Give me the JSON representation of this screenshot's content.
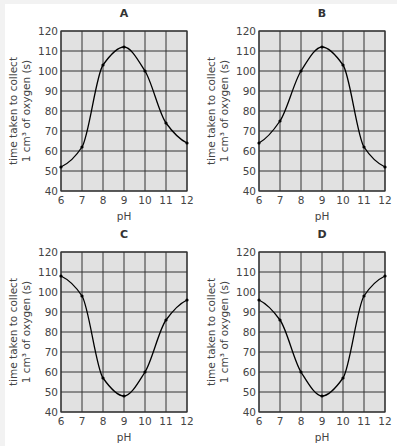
{
  "figure": {
    "background": "#f2f2f2",
    "panel_background": "#ffffff",
    "plot_fill": "#e1e1e1",
    "grid_color": "#333333",
    "curve_color": "#000000"
  },
  "chart_data": [
    {
      "type": "line",
      "title": "A",
      "xlabel": "pH",
      "ylabel_line1": "time taken to collect",
      "ylabel_line2": "1 cm³ of oxygen (s)",
      "x": [
        6,
        7,
        8,
        9,
        10,
        11,
        12
      ],
      "values": [
        52,
        62,
        103,
        112,
        100,
        74,
        64
      ],
      "xlim": [
        6,
        12
      ],
      "ylim": [
        40,
        120
      ],
      "xticks": [
        "6",
        "7",
        "8",
        "9",
        "10",
        "11",
        "12"
      ],
      "yticks": [
        "40",
        "50",
        "60",
        "70",
        "80",
        "90",
        "100",
        "110",
        "120"
      ],
      "grid": true
    },
    {
      "type": "line",
      "title": "B",
      "xlabel": "pH",
      "ylabel_line1": "time taken to collect",
      "ylabel_line2": "1 cm³ of oxygen (s)",
      "x": [
        6,
        7,
        8,
        9,
        10,
        11,
        12
      ],
      "values": [
        64,
        75,
        100,
        112,
        103,
        62,
        52
      ],
      "xlim": [
        6,
        12
      ],
      "ylim": [
        40,
        120
      ],
      "xticks": [
        "6",
        "7",
        "8",
        "9",
        "10",
        "11",
        "12"
      ],
      "yticks": [
        "40",
        "50",
        "60",
        "70",
        "80",
        "90",
        "100",
        "110",
        "120"
      ],
      "grid": true
    },
    {
      "type": "line",
      "title": "C",
      "xlabel": "pH",
      "ylabel_line1": "time taken to collect",
      "ylabel_line2": "1 cm³ of oxygen (s)",
      "x": [
        6,
        7,
        8,
        9,
        10,
        11,
        12
      ],
      "values": [
        108,
        98,
        57,
        48,
        60,
        86,
        96
      ],
      "xlim": [
        6,
        12
      ],
      "ylim": [
        40,
        120
      ],
      "xticks": [
        "6",
        "7",
        "8",
        "9",
        "10",
        "11",
        "12"
      ],
      "yticks": [
        "40",
        "50",
        "60",
        "70",
        "80",
        "90",
        "100",
        "110",
        "120"
      ],
      "grid": true
    },
    {
      "type": "line",
      "title": "D",
      "xlabel": "pH",
      "ylabel_line1": "time taken to collect",
      "ylabel_line2": "1 cm³ of oxygen (s)",
      "x": [
        6,
        7,
        8,
        9,
        10,
        11,
        12
      ],
      "values": [
        96,
        86,
        60,
        48,
        57,
        98,
        108
      ],
      "xlim": [
        6,
        12
      ],
      "ylim": [
        40,
        120
      ],
      "xticks": [
        "6",
        "7",
        "8",
        "9",
        "10",
        "11",
        "12"
      ],
      "yticks": [
        "40",
        "50",
        "60",
        "70",
        "80",
        "90",
        "100",
        "110",
        "120"
      ],
      "grid": true
    }
  ]
}
